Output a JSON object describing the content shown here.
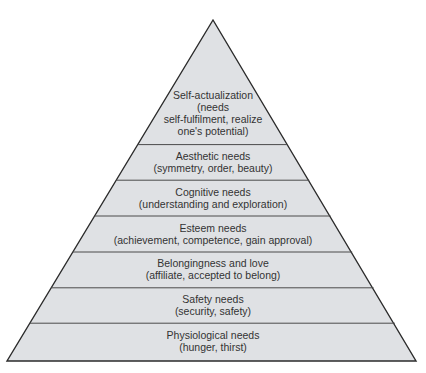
{
  "diagram": {
    "colors": {
      "fill": "#dfe1e4",
      "outline": "#2b2b2b",
      "divider": "#4a4a4a",
      "text": "#333333"
    },
    "tiers": [
      {
        "id": "self-actualization",
        "lines": [
          "Self-actualization",
          "(needs",
          "self-fulfilment, realize",
          "one's potential)"
        ]
      },
      {
        "id": "aesthetic",
        "lines": [
          "Aesthetic needs",
          "(symmetry, order, beauty)"
        ]
      },
      {
        "id": "cognitive",
        "lines": [
          "Cognitive needs",
          "(understanding and exploration)"
        ]
      },
      {
        "id": "esteem",
        "lines": [
          "Esteem needs",
          "(achievement, competence, gain approval)"
        ]
      },
      {
        "id": "belongingness",
        "lines": [
          "Belongingness and love",
          "(affiliate, accepted to belong)"
        ]
      },
      {
        "id": "safety",
        "lines": [
          "Safety needs",
          "(security, safety)"
        ]
      },
      {
        "id": "physiological",
        "lines": [
          "Physiological needs",
          "(hunger, thirst)"
        ]
      }
    ]
  }
}
